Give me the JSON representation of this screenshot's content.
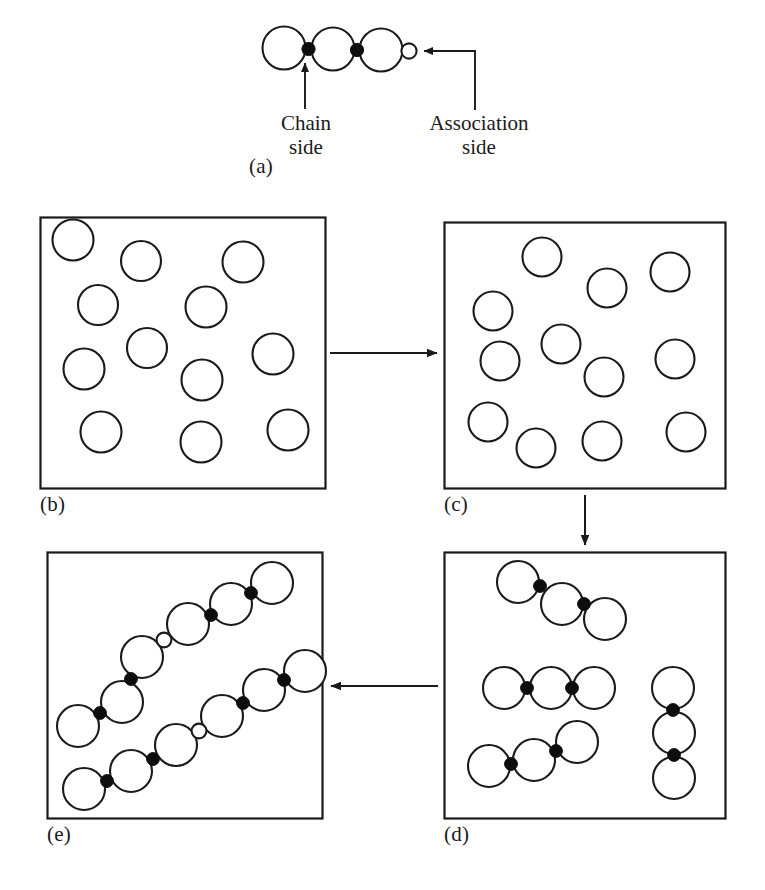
{
  "figure": {
    "type": "schematic-diagram",
    "background": "#ffffff",
    "stroke_color": "#1a1a1a",
    "fill_open": "#ffffff",
    "fill_solid": "#0d0d0d"
  },
  "labels": {
    "a": "(a)",
    "b": "(b)",
    "c": "(c)",
    "d": "(d)",
    "e": "(e)"
  },
  "callouts": {
    "chain_side": "Chain\nside",
    "association_side": "Association\nside"
  },
  "panels": [
    {
      "id": "a",
      "label": "(a)",
      "caption": "Single trimer unit with two chain-side junctions and one association-side site",
      "has_box": false,
      "monomers": 3,
      "chain_junctions": 2,
      "association_sites": 1
    },
    {
      "id": "b",
      "label": "(b)",
      "caption": "Dispersed unassociated monomers",
      "has_box": true,
      "monomers": 12,
      "chain_junctions": 0,
      "association_sites": 0
    },
    {
      "id": "c",
      "label": "(c)",
      "caption": "Dispersed monomers rearranged",
      "has_box": true,
      "monomers": 13,
      "chain_junctions": 0,
      "association_sites": 0
    },
    {
      "id": "d",
      "label": "(d)",
      "caption": "Monomers linked into four separate trimers",
      "has_box": true,
      "monomers": 12,
      "chain_junctions": 8,
      "association_sites": 0,
      "chains": 4,
      "chain_length": 3
    },
    {
      "id": "e",
      "label": "(e)",
      "caption": "Trimers joined at association sites into two hexamer chains",
      "has_box": true,
      "monomers": 12,
      "chain_junctions": 8,
      "association_sites": 2,
      "chains": 2,
      "chain_length": 6
    }
  ],
  "arrows": [
    {
      "id": "b-to-c",
      "from": "b",
      "to": "c",
      "direction": "right"
    },
    {
      "id": "c-to-d",
      "from": "c",
      "to": "d",
      "direction": "down"
    },
    {
      "id": "d-to-e",
      "from": "d",
      "to": "e",
      "direction": "left"
    }
  ],
  "legend": {
    "open_large_circle": "monomer bead",
    "solid_small_circle": "chain-side junction",
    "open_small_circle": "association-side site"
  }
}
